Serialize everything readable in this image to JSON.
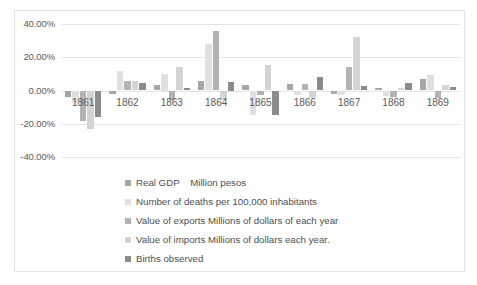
{
  "chart_data": {
    "type": "bar",
    "title": "",
    "xlabel": "",
    "ylabel": "",
    "ylim": [
      -40,
      40
    ],
    "ytick_labels": [
      "40.00%",
      "20.00%",
      "0.00%",
      "-20.00%",
      "-40.00%"
    ],
    "ytick_values": [
      40,
      20,
      0,
      -20,
      -40
    ],
    "grid": true,
    "legend_position": "bottom",
    "categories": [
      "1861",
      "1862",
      "1863",
      "1864",
      "1865",
      "1866",
      "1867",
      "1868",
      "1869"
    ],
    "series": [
      {
        "name": "Real GDP    Million pesos",
        "color": "#a6a6a6",
        "values": [
          -4.0,
          -2.0,
          3.5,
          5.5,
          3.5,
          4.0,
          -2.0,
          1.5,
          7.0
        ]
      },
      {
        "name": "Number of deaths per 100,000 inhabitants",
        "color": "#e0e0e0",
        "values": [
          -7.5,
          11.5,
          10.0,
          28.0,
          -15.0,
          -3.0,
          -2.5,
          -3.5,
          9.5
        ]
      },
      {
        "name": "Value of exports Millions of dollars of each year",
        "color": "#b3b3b3",
        "values": [
          -18.5,
          6.0,
          -5.5,
          36.0,
          -2.5,
          4.0,
          14.0,
          -4.0,
          -4.5
        ]
      },
      {
        "name": "Value of imports Millions of dollars each year.",
        "color": "#d4d4d4",
        "values": [
          -23.0,
          5.5,
          14.0,
          -6.0,
          15.5,
          -4.5,
          32.0,
          1.5,
          3.5
        ]
      },
      {
        "name": "Births observed",
        "color": "#8c8c8c",
        "values": [
          -16.0,
          4.5,
          1.5,
          5.0,
          -14.5,
          8.0,
          3.0,
          4.5,
          2.0
        ]
      }
    ]
  },
  "legend": {
    "items": [
      {
        "label": "Real GDP    Million pesos",
        "swatch": "#a6a6a6"
      },
      {
        "label": "Number of deaths per 100,000 inhabitants",
        "swatch": "#e0e0e0"
      },
      {
        "label": "Value of exports Millions of dollars of each year",
        "swatch": "#b3b3b3"
      },
      {
        "label": "Value of imports Millions of dollars each year.",
        "swatch": "#d4d4d4"
      },
      {
        "label": "Births observed",
        "swatch": "#8c8c8c"
      }
    ]
  }
}
